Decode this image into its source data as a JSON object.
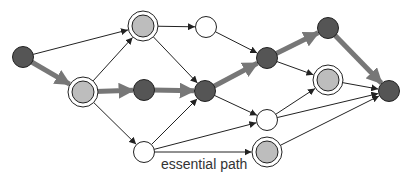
{
  "caption": "essential path",
  "colors": {
    "dark_node": "#555555",
    "light_node": "#bdbdbd",
    "white_node": "#ffffff",
    "stroke": "#222222",
    "essential_path": "#777777"
  },
  "nodes": [
    {
      "id": "A",
      "x": 23,
      "y": 57,
      "fill": "dark",
      "ring": false
    },
    {
      "id": "B",
      "x": 83,
      "y": 92,
      "fill": "light",
      "ring": true
    },
    {
      "id": "C",
      "x": 143,
      "y": 26,
      "fill": "light",
      "ring": true
    },
    {
      "id": "D",
      "x": 206,
      "y": 27,
      "fill": "white",
      "ring": false
    },
    {
      "id": "E",
      "x": 144,
      "y": 90,
      "fill": "dark",
      "ring": false
    },
    {
      "id": "F",
      "x": 205,
      "y": 91,
      "fill": "dark",
      "ring": false
    },
    {
      "id": "G",
      "x": 144,
      "y": 152,
      "fill": "white",
      "ring": false
    },
    {
      "id": "H",
      "x": 267,
      "y": 58,
      "fill": "dark",
      "ring": false
    },
    {
      "id": "M",
      "x": 328,
      "y": 28,
      "fill": "dark",
      "ring": false
    },
    {
      "id": "J",
      "x": 328,
      "y": 80,
      "fill": "light",
      "ring": true
    },
    {
      "id": "I",
      "x": 267,
      "y": 120,
      "fill": "white",
      "ring": false
    },
    {
      "id": "K",
      "x": 267,
      "y": 152,
      "fill": "light",
      "ring": true
    },
    {
      "id": "L",
      "x": 389,
      "y": 91,
      "fill": "dark",
      "ring": false
    }
  ],
  "edges": [
    {
      "from": "A",
      "to": "C",
      "essential": false
    },
    {
      "from": "A",
      "to": "B",
      "essential": true
    },
    {
      "from": "B",
      "to": "C",
      "essential": false
    },
    {
      "from": "B",
      "to": "E",
      "essential": true
    },
    {
      "from": "B",
      "to": "G",
      "essential": false
    },
    {
      "from": "C",
      "to": "D",
      "essential": false
    },
    {
      "from": "C",
      "to": "F",
      "essential": false
    },
    {
      "from": "E",
      "to": "F",
      "essential": true
    },
    {
      "from": "G",
      "to": "F",
      "essential": false
    },
    {
      "from": "G",
      "to": "I",
      "essential": false
    },
    {
      "from": "G",
      "to": "K",
      "essential": false
    },
    {
      "from": "D",
      "to": "H",
      "essential": false
    },
    {
      "from": "F",
      "to": "H",
      "essential": true
    },
    {
      "from": "F",
      "to": "I",
      "essential": false
    },
    {
      "from": "H",
      "to": "M",
      "essential": true
    },
    {
      "from": "H",
      "to": "J",
      "essential": false
    },
    {
      "from": "I",
      "to": "J",
      "essential": false
    },
    {
      "from": "I",
      "to": "L",
      "essential": false
    },
    {
      "from": "J",
      "to": "L",
      "essential": false
    },
    {
      "from": "K",
      "to": "L",
      "essential": false
    },
    {
      "from": "M",
      "to": "L",
      "essential": true
    }
  ]
}
